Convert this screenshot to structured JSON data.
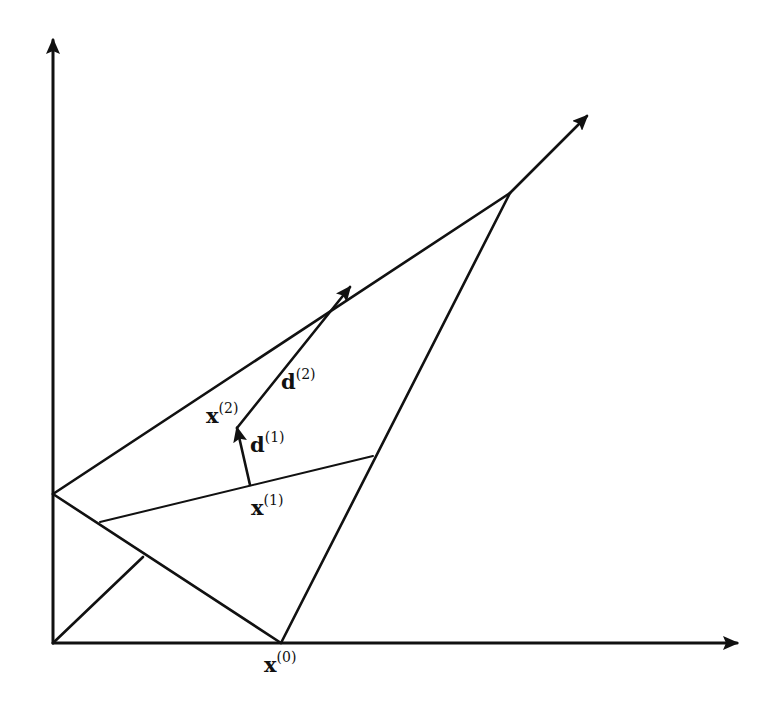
{
  "figure": {
    "stroke_color": "#111111",
    "background": "#ffffff",
    "axes": {
      "origin": [
        53,
        643
      ],
      "y_axis_tip": [
        53,
        40
      ],
      "x_axis_tip": [
        737,
        643
      ]
    },
    "segments": [
      {
        "name": "edge-yaxis-to-apex",
        "from": [
          53,
          494
        ],
        "to": [
          510,
          193
        ]
      },
      {
        "name": "ray-apex-extension",
        "from": [
          510,
          193
        ],
        "to": [
          587,
          116
        ],
        "arrow": true
      },
      {
        "name": "edge-x0-to-apex",
        "from": [
          281,
          643
        ],
        "to": [
          510,
          193
        ]
      },
      {
        "name": "edge-yaxis-to-x0",
        "from": [
          53,
          494
        ],
        "to": [
          281,
          643
        ]
      },
      {
        "name": "line-through-x1",
        "from": [
          100,
          522
        ],
        "to": [
          373,
          456
        ],
        "thin": true
      },
      {
        "name": "diagonal-from-origin",
        "from": [
          53,
          643
        ],
        "to": [
          143,
          557
        ]
      },
      {
        "name": "direction-d1",
        "from": [
          250,
          485
        ],
        "to": [
          237,
          428
        ],
        "arrow": true
      },
      {
        "name": "direction-d2",
        "from": [
          237,
          428
        ],
        "to": [
          350,
          287
        ],
        "arrow": true
      }
    ],
    "labels": [
      {
        "id": "x0",
        "base": "x",
        "sup": "(0)",
        "pos": [
          264,
          652
        ]
      },
      {
        "id": "x1",
        "base": "x",
        "sup": "(1)",
        "pos": [
          251,
          495
        ]
      },
      {
        "id": "x2",
        "base": "x",
        "sup": "(2)",
        "pos": [
          206,
          403
        ]
      },
      {
        "id": "d1",
        "base": "d",
        "sup": "(1)",
        "pos": [
          250,
          432
        ]
      },
      {
        "id": "d2",
        "base": "d",
        "sup": "(2)",
        "pos": [
          281,
          369
        ]
      }
    ]
  }
}
